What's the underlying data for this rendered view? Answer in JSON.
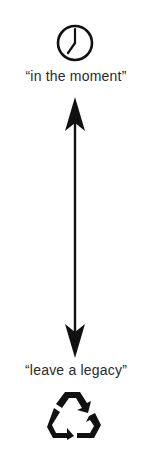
{
  "top": {
    "icon": "clock-icon",
    "label": "“in the moment”"
  },
  "connector": {
    "icon": "double-headed-arrow-icon"
  },
  "bottom": {
    "label": "“leave a legacy”",
    "icon": "recycle-icon"
  },
  "colors": {
    "ink": "#111111",
    "background": "#ffffff"
  }
}
